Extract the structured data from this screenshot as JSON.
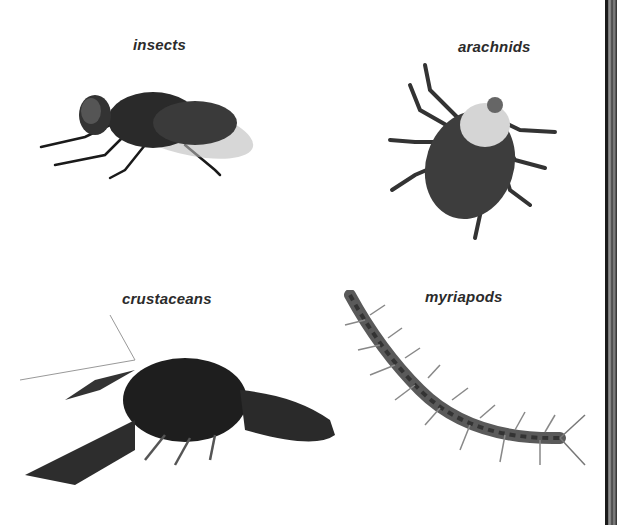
{
  "figure": {
    "panels": [
      {
        "label": "insects",
        "subject": "fly"
      },
      {
        "label": "arachnids",
        "subject": "tick"
      },
      {
        "label": "crustaceans",
        "subject": "crayfish"
      },
      {
        "label": "myriapods",
        "subject": "centipede"
      }
    ],
    "colors": {
      "background": "#ffffff",
      "label_text": "#2b2b2b"
    }
  }
}
